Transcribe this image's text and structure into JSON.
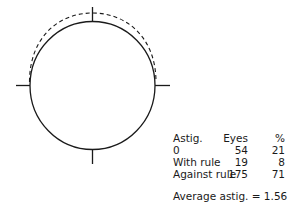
{
  "table": {
    "headers": [
      "Astig.",
      "Eyes",
      "%"
    ],
    "rows": [
      {
        "label": "0",
        "eyes": "54",
        "pct": "21"
      },
      {
        "label": "With rule",
        "eyes": "19",
        "pct": "8"
      },
      {
        "label": "Against rule",
        "eyes": "175",
        "pct": "71"
      }
    ]
  },
  "summary": "Average astig. = 1.56"
}
